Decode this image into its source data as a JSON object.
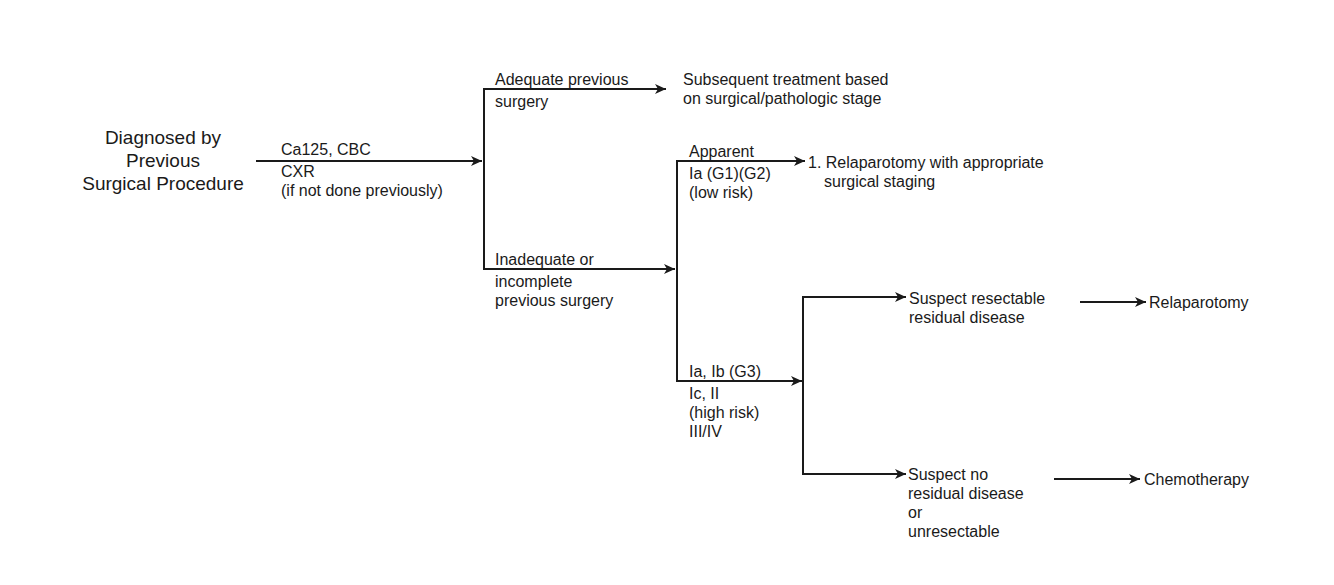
{
  "root": {
    "lines": [
      "Diagnosed by",
      "Previous",
      "Surgical Procedure"
    ]
  },
  "workup": {
    "lines": [
      "Ca125, CBC",
      "CXR",
      "(if not done previously)"
    ]
  },
  "branch_adequate": {
    "label": [
      "Adequate previous",
      "surgery"
    ],
    "outcome": [
      "Subsequent treatment based",
      "on surgical/pathologic stage"
    ]
  },
  "branch_inadequate": {
    "label": [
      "Inadequate or",
      "incomplete",
      "previous surgery"
    ]
  },
  "branch_low_risk": {
    "label": [
      "Apparent",
      "Ia (G1)(G2)",
      "(low risk)"
    ],
    "outcome": [
      "1. Relaparotomy with appropriate",
      "surgical staging"
    ]
  },
  "branch_high_risk": {
    "label": [
      "Ia, Ib (G3)",
      "Ic, II",
      "(high risk)",
      "III/IV"
    ]
  },
  "branch_resectable": {
    "label": [
      "Suspect resectable",
      "residual disease"
    ],
    "outcome": "Relaparotomy"
  },
  "branch_no_residual": {
    "label": [
      "Suspect no",
      "residual disease",
      "or",
      "unresectable"
    ],
    "outcome": "Chemotherapy"
  },
  "colors": {
    "line": "#1a1a1a",
    "text": "#1a1a1a",
    "background": "#ffffff"
  }
}
